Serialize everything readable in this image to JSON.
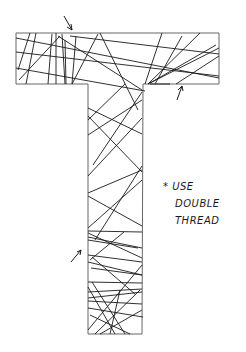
{
  "sketch": {
    "subject": "Letter T outline filled with crisscrossing straight thread lines",
    "outline_color": "#555555",
    "thread_color": "#1a1a1a",
    "arrows": [
      "top-arrow",
      "right-arrow",
      "left-arrow"
    ]
  },
  "note": {
    "marker": "*",
    "line1": "USE",
    "line2": "DOUBLE",
    "line3": "THREAD"
  }
}
